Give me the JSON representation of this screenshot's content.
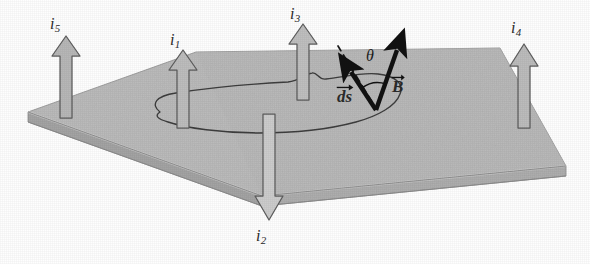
{
  "figure": {
    "kind": "physics-diagram",
    "topic": "Ampere's law: Amperian loop on a surface pierced by currents",
    "colors": {
      "surface_top": "#bcbcbc",
      "surface_edge": "#9d9d9d",
      "surface_front": "#aeaeae",
      "arrow_fill": "#b6b6b6",
      "arrow_fill_light": "#d2d2d2",
      "arrow_stroke": "#595959",
      "loop_stroke": "#3a3a3a",
      "vector_black": "#121212",
      "background": "#ffffff"
    }
  },
  "currents": [
    {
      "id": "i5",
      "symbol": "i",
      "subscript": "5",
      "direction": "up",
      "label_x": 50,
      "label_y": 16
    },
    {
      "id": "i1",
      "symbol": "i",
      "subscript": "1",
      "direction": "up",
      "label_x": 170,
      "label_y": 32
    },
    {
      "id": "i3",
      "symbol": "i",
      "subscript": "3",
      "direction": "up",
      "label_x": 290,
      "label_y": 6
    },
    {
      "id": "i4",
      "symbol": "i",
      "subscript": "4",
      "direction": "up",
      "label_x": 511,
      "label_y": 20
    },
    {
      "id": "i2",
      "symbol": "i",
      "subscript": "2",
      "direction": "down",
      "label_x": 256,
      "label_y": 228
    }
  ],
  "vectors": [
    {
      "id": "ds",
      "symbol": "ds",
      "overarrow": true,
      "label_x": 337,
      "label_y": 88,
      "direction": "up-left"
    },
    {
      "id": "B",
      "symbol": "B",
      "overarrow": true,
      "label_x": 392,
      "label_y": 78,
      "direction": "up-right"
    }
  ],
  "angle": {
    "id": "theta",
    "symbol": "θ",
    "label_x": 366,
    "label_y": 48
  },
  "loop": {
    "name": "amperian-loop",
    "closed": true,
    "style": "irregular-closed-curve"
  },
  "dashed_line": {
    "name": "ds-extension",
    "style": "dashed"
  }
}
